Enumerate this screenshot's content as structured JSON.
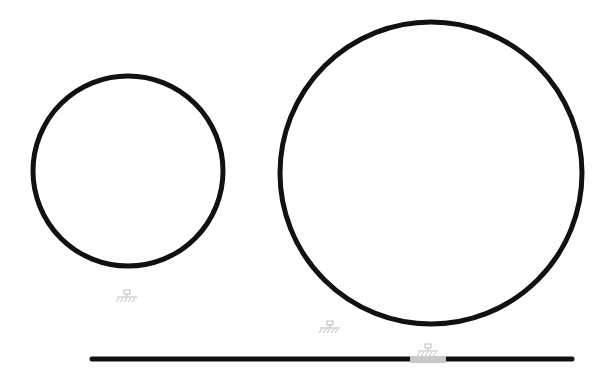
{
  "diagram": {
    "width": 612,
    "height": 379,
    "background": "#ffffff",
    "stroke_color": "#111111",
    "faint_color": "#bdbdbd",
    "highlight_color": "#c8c8c8",
    "circles": [
      {
        "name": "small-circle",
        "cx": 128,
        "cy": 171,
        "r": 95,
        "stroke_width": 5
      },
      {
        "name": "large-circle",
        "cx": 431,
        "cy": 173,
        "r": 151,
        "stroke_width": 5
      }
    ],
    "baseline": {
      "x1": 92,
      "y1": 359,
      "x2": 572,
      "y2": 359,
      "stroke_width": 5
    },
    "baseline_highlight": {
      "x": 410,
      "y": 356,
      "width": 36,
      "height": 7
    },
    "ground_symbols": [
      {
        "name": "ground-symbol-small",
        "x": 127,
        "y": 297
      },
      {
        "name": "ground-symbol-large",
        "x": 330,
        "y": 328
      },
      {
        "name": "ground-symbol-baseline",
        "x": 428,
        "y": 351
      }
    ]
  }
}
